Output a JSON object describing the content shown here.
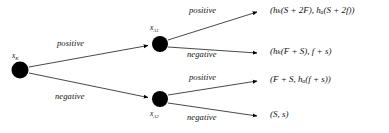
{
  "diagram": {
    "type": "decision-tree",
    "background_color": "#ffffff",
    "line_color": "#1a1a1a",
    "node_color": "#000000",
    "nodes": [
      {
        "id": "root",
        "label_text": "x",
        "label_sub": "K",
        "x": 20,
        "y": 70,
        "r": 8.5
      },
      {
        "id": "upper",
        "label_text": "x",
        "label_sub": "A1",
        "x": 160,
        "y": 44,
        "r": 8.0
      },
      {
        "id": "lower",
        "label_text": "x",
        "label_sub": "A2",
        "x": 160,
        "y": 99,
        "r": 8.0
      }
    ],
    "edges": [
      {
        "id": "root-upper",
        "label": "positive"
      },
      {
        "id": "root-lower",
        "label": "negative"
      },
      {
        "id": "upper-outcome1",
        "label": "positive"
      },
      {
        "id": "upper-outcome2",
        "label": "negative"
      },
      {
        "id": "lower-outcome3",
        "label": "positive"
      },
      {
        "id": "lower-outcome4",
        "label": "negative"
      }
    ],
    "outcomes": [
      {
        "id": "outcome-1",
        "text": "(hₖ(S + 2F), hₐ(S + 2f))",
        "plain": "(h_K(S + 2F), h_A(S + 2f))"
      },
      {
        "id": "outcome-2",
        "text": "(hₖ(F + S), f + s)",
        "plain": "(h_K(F + S), f + s)"
      },
      {
        "id": "outcome-3",
        "text": "(F + S, hₐ(f + s))",
        "plain": "(F + S, h_A(f + s))"
      },
      {
        "id": "outcome-4",
        "text": "(S, s)",
        "plain": "(S, s)"
      }
    ]
  }
}
